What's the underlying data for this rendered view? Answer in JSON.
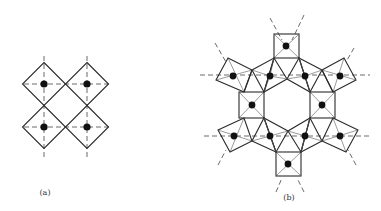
{
  "figure": {
    "panel_a": {
      "label": "(a)",
      "description": "Four corner-sharing square (octahedral) units in a 2x2 arrangement",
      "centers": [
        [
          44,
          84
        ],
        [
          87,
          84
        ],
        [
          44,
          127
        ],
        [
          87,
          127
        ]
      ],
      "half_size": 21.5
    },
    "panel_b": {
      "label": "(b)",
      "description": "Six-membered ring of corner-sharing polyhedra forming a hexagonal channel",
      "square_centers": [
        [
          286,
          46
        ],
        [
          252,
          105
        ],
        [
          322,
          105
        ],
        [
          288,
          164
        ]
      ],
      "polyhedra_centers": [
        [
          233,
          76
        ],
        [
          270,
          76
        ],
        [
          305,
          76
        ],
        [
          340,
          76
        ],
        [
          234,
          136
        ],
        [
          270,
          136
        ],
        [
          305,
          136
        ],
        [
          340,
          136
        ]
      ]
    },
    "colors": {
      "line": "#2a2a2a",
      "atom": "#111111",
      "background": "#ffffff"
    }
  }
}
